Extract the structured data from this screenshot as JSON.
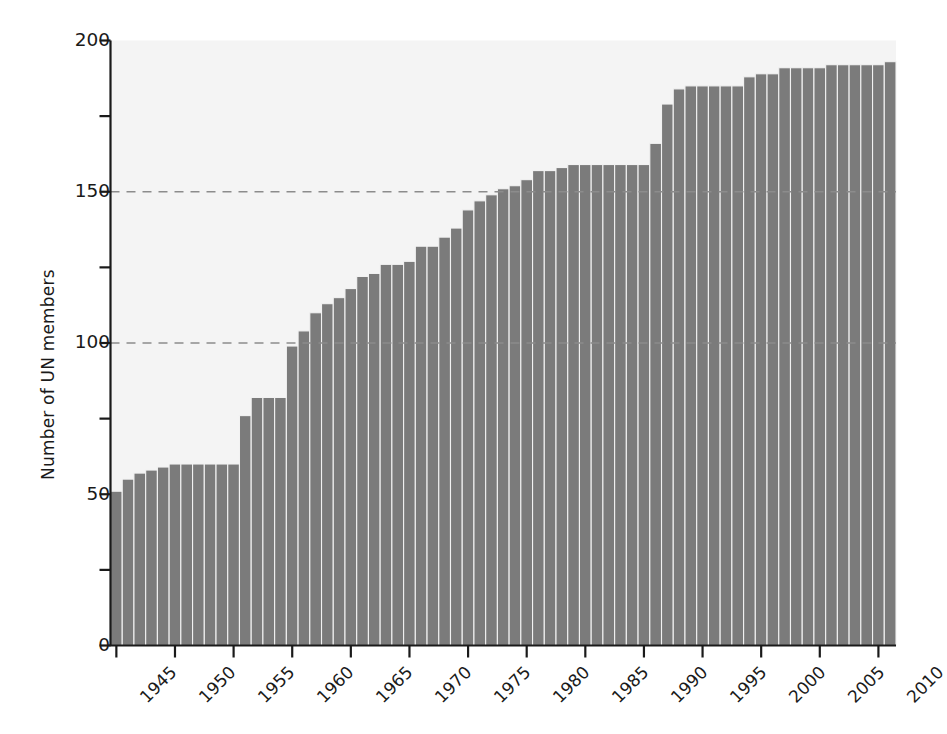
{
  "chart_data": {
    "type": "bar",
    "title": "",
    "subtitle": "",
    "xlabel": "",
    "ylabel": "Number of UN members",
    "xlim": [
      1944.5,
      2011.5
    ],
    "ylim": [
      0,
      200
    ],
    "grid": "horizontal dashed gridlines at y = 100 and y = 150 only",
    "legend": "none",
    "bar_color": "#7b7b7b",
    "bar_edge_color": "#f2f2f2",
    "plot_background": "#f4f4f4",
    "axis_color": "#1a1a1a",
    "gridline_color": "#8c8c8c",
    "y_major_ticks": [
      0,
      50,
      100,
      150,
      200
    ],
    "y_major_tick_labels": [
      "0",
      "50",
      "100",
      "150",
      "200"
    ],
    "y_minor_ticks": [
      25,
      75,
      125,
      175
    ],
    "x_major_ticks": [
      1945,
      1950,
      1955,
      1960,
      1965,
      1970,
      1975,
      1980,
      1985,
      1990,
      1995,
      2000,
      2005,
      2010
    ],
    "x_major_tick_labels": [
      "1945",
      "1950",
      "1955",
      "1960",
      "1965",
      "1970",
      "1975",
      "1980",
      "1985",
      "1990",
      "1995",
      "2000",
      "2005",
      "2010"
    ],
    "x_tick_label_rotation": -45,
    "categories": [
      1945,
      1946,
      1947,
      1948,
      1949,
      1950,
      1951,
      1952,
      1953,
      1954,
      1955,
      1956,
      1957,
      1958,
      1959,
      1960,
      1961,
      1962,
      1963,
      1964,
      1965,
      1966,
      1967,
      1968,
      1969,
      1970,
      1971,
      1972,
      1973,
      1974,
      1975,
      1976,
      1977,
      1978,
      1979,
      1980,
      1981,
      1982,
      1983,
      1984,
      1985,
      1986,
      1987,
      1988,
      1989,
      1990,
      1991,
      1992,
      1993,
      1994,
      1995,
      1996,
      1997,
      1998,
      1999,
      2000,
      2001,
      2002,
      2003,
      2004,
      2005,
      2006,
      2007,
      2008,
      2009,
      2010,
      2011
    ],
    "values": [
      51,
      55,
      57,
      58,
      59,
      60,
      60,
      60,
      60,
      60,
      60,
      76,
      82,
      82,
      82,
      99,
      104,
      110,
      113,
      115,
      118,
      122,
      123,
      126,
      126,
      127,
      132,
      132,
      135,
      138,
      144,
      147,
      149,
      151,
      152,
      154,
      157,
      157,
      158,
      159,
      159,
      159,
      159,
      159,
      159,
      159,
      166,
      179,
      184,
      185,
      185,
      185,
      185,
      185,
      188,
      189,
      189,
      191,
      191,
      191,
      191,
      192,
      192,
      192,
      192,
      192,
      193
    ],
    "annotations": []
  }
}
